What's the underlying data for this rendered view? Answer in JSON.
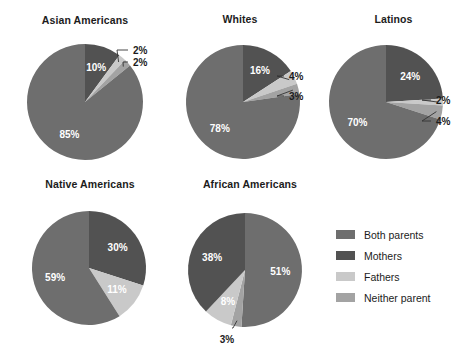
{
  "chart_data": {
    "type": "pie",
    "title": "",
    "legend_position": "bottom-right",
    "categories": [
      "Both parents",
      "Mothers",
      "Fathers",
      "Neither parent"
    ],
    "colors": {
      "both_parents": "#6e6e6e",
      "mothers": "#525252",
      "fathers": "#c9c9c9",
      "neither_parent": "#a3a3a3",
      "background": "#ffffff",
      "text": "#1c1c1c",
      "slice_label": "#ffffff",
      "leader_line": "#333333"
    },
    "charts": [
      {
        "title": "Asian Americans",
        "slices": [
          {
            "category": "Mothers",
            "value": 10,
            "label": "10%",
            "placement": "inside"
          },
          {
            "category": "Fathers",
            "value": 2,
            "label": "2%",
            "placement": "callout"
          },
          {
            "category": "Neither parent",
            "value": 2,
            "label": "2%",
            "placement": "callout"
          },
          {
            "category": "Both parents",
            "value": 85,
            "label": "85%",
            "placement": "inside"
          }
        ]
      },
      {
        "title": "Whites",
        "slices": [
          {
            "category": "Mothers",
            "value": 16,
            "label": "16%",
            "placement": "inside"
          },
          {
            "category": "Fathers",
            "value": 4,
            "label": "4%",
            "placement": "callout"
          },
          {
            "category": "Neither parent",
            "value": 3,
            "label": "3%",
            "placement": "callout"
          },
          {
            "category": "Both parents",
            "value": 78,
            "label": "78%",
            "placement": "inside"
          }
        ]
      },
      {
        "title": "Latinos",
        "slices": [
          {
            "category": "Mothers",
            "value": 24,
            "label": "24%",
            "placement": "inside"
          },
          {
            "category": "Fathers",
            "value": 2,
            "label": "2%",
            "placement": "callout"
          },
          {
            "category": "Neither parent",
            "value": 4,
            "label": "4%",
            "placement": "callout"
          },
          {
            "category": "Both parents",
            "value": 70,
            "label": "70%",
            "placement": "inside"
          }
        ]
      },
      {
        "title": "Native Americans",
        "slices": [
          {
            "category": "Mothers",
            "value": 30,
            "label": "30%",
            "placement": "inside"
          },
          {
            "category": "Fathers",
            "value": 11,
            "label": "11%",
            "placement": "inside"
          },
          {
            "category": "Both parents",
            "value": 59,
            "label": "59%",
            "placement": "inside"
          }
        ]
      },
      {
        "title": "African Americans",
        "slices": [
          {
            "category": "Both parents",
            "value": 51,
            "label": "51%",
            "placement": "inside"
          },
          {
            "category": "Neither parent",
            "value": 3,
            "label": "3%",
            "placement": "callout"
          },
          {
            "category": "Fathers",
            "value": 8,
            "label": "8%",
            "placement": "inside"
          },
          {
            "category": "Mothers",
            "value": 38,
            "label": "38%",
            "placement": "inside"
          }
        ]
      }
    ]
  },
  "legend": {
    "items": [
      {
        "label": "Both parents",
        "color": "#6e6e6e"
      },
      {
        "label": "Mothers",
        "color": "#525252"
      },
      {
        "label": "Fathers",
        "color": "#c9c9c9"
      },
      {
        "label": "Neither parent",
        "color": "#a3a3a3"
      }
    ]
  },
  "layout": {
    "panels": [
      {
        "left": 5,
        "top": 14,
        "width": 160,
        "pie_cx": 80,
        "pie_cy": 88,
        "pie_r": 58,
        "callouts": [
          {
            "label_x": 128,
            "label_y": 36,
            "elbow_x": 112,
            "kink_y": 36
          },
          {
            "label_x": 128,
            "label_y": 48,
            "elbow_x": 118,
            "kink_y": 48
          }
        ]
      },
      {
        "left": 165,
        "top": 13,
        "width": 150,
        "pie_cx": 78,
        "pie_cy": 89,
        "pie_r": 57,
        "callouts": [
          {
            "label_x": 124,
            "label_y": 63,
            "elbow_x": 112,
            "kink_y": 63
          },
          {
            "label_x": 124,
            "label_y": 83,
            "elbow_x": 112,
            "kink_y": 83
          }
        ]
      },
      {
        "left": 318,
        "top": 13,
        "width": 151,
        "pie_cx": 68,
        "pie_cy": 89,
        "pie_r": 57,
        "callouts": [
          {
            "label_x": 118,
            "label_y": 87,
            "elbow_x": 104,
            "kink_y": 87
          },
          {
            "label_x": 118,
            "label_y": 108,
            "elbow_x": 104,
            "kink_y": 108
          }
        ]
      },
      {
        "left": 10,
        "top": 178,
        "width": 160,
        "pie_cx": 79,
        "pie_cy": 90,
        "pie_r": 57,
        "callouts": []
      },
      {
        "left": 170,
        "top": 178,
        "width": 160,
        "pie_cx": 75,
        "pie_cy": 92,
        "pie_r": 57,
        "callouts": [
          {
            "label_x": 57,
            "label_y": 161,
            "elbow_x": 63,
            "kink_y": 150
          }
        ]
      }
    ]
  }
}
